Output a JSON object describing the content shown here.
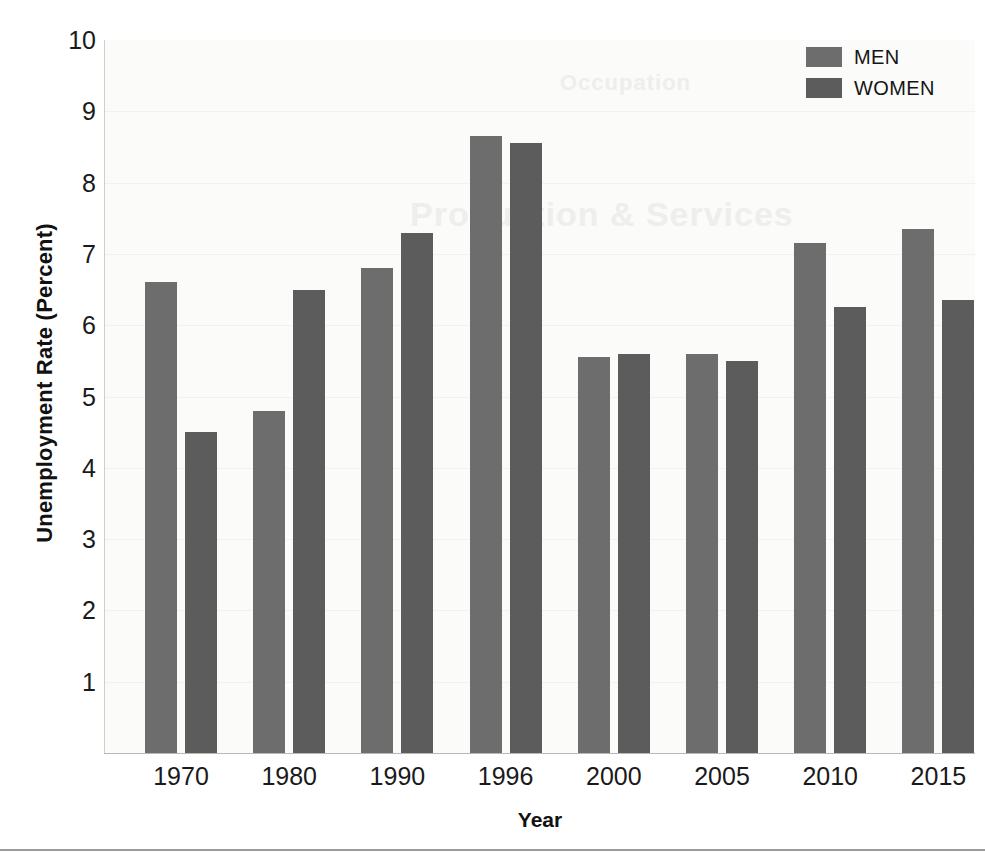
{
  "chart_data": {
    "type": "bar",
    "title": "",
    "xlabel": "Year",
    "ylabel": "Unemployment Rate (Percent)",
    "categories": [
      "1970",
      "1980",
      "1990",
      "1996",
      "2000",
      "2005",
      "2010",
      "2015"
    ],
    "series": [
      {
        "name": "MEN",
        "color": "#6d6d6d",
        "values": [
          6.6,
          4.8,
          6.8,
          8.65,
          5.55,
          5.6,
          7.15,
          7.35
        ]
      },
      {
        "name": "WOMEN",
        "color": "#5c5c5c",
        "values": [
          4.5,
          6.5,
          7.3,
          8.55,
          5.6,
          5.5,
          6.25,
          6.35
        ]
      }
    ],
    "ylim": [
      0,
      10
    ],
    "yticks": [
      1,
      2,
      3,
      4,
      5,
      6,
      7,
      8,
      9,
      10
    ],
    "ytick_labels": [
      "1",
      "2",
      "3",
      "4",
      "5",
      "6",
      "7",
      "8",
      "9",
      "10"
    ],
    "grid": true,
    "legend_position": "top-right"
  },
  "legend": {
    "entries": [
      {
        "label": "MEN",
        "swatch": "men-swatch"
      },
      {
        "label": "WOMEN",
        "swatch": "women-swatch"
      }
    ]
  },
  "ghost_text": {
    "line1": "Production & Services",
    "line2": "Occupation"
  }
}
